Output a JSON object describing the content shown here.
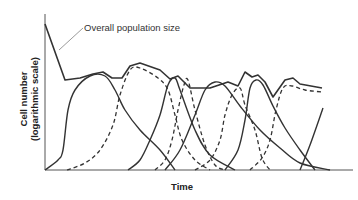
{
  "chart_data": {
    "type": "line",
    "title": "",
    "xlabel": "Time",
    "ylabel_line1": "Cell number",
    "ylabel_line2": "(logarithmic scale)",
    "annotation": "Overall population size",
    "grid": false,
    "legend": "none",
    "ticks": "none",
    "colors": {
      "line": "#333333",
      "axis": "#555555"
    },
    "plot_area": {
      "x0": 45,
      "y0": 170,
      "x1": 353,
      "ytop": 14
    },
    "overall": [
      [
        45,
        24
      ],
      [
        65,
        80
      ],
      [
        80,
        78
      ],
      [
        93,
        74
      ],
      [
        103,
        72
      ],
      [
        112,
        78
      ],
      [
        122,
        78
      ],
      [
        130,
        66
      ],
      [
        140,
        63
      ],
      [
        160,
        70
      ],
      [
        170,
        79
      ],
      [
        178,
        76
      ],
      [
        190,
        88
      ],
      [
        210,
        88
      ],
      [
        228,
        82
      ],
      [
        238,
        86
      ],
      [
        245,
        72
      ],
      [
        252,
        77
      ],
      [
        258,
        75
      ],
      [
        265,
        82
      ],
      [
        273,
        97
      ],
      [
        285,
        80
      ],
      [
        293,
        78
      ],
      [
        300,
        84
      ],
      [
        322,
        88
      ]
    ],
    "subpopulations": [
      {
        "style": "solid",
        "points": [
          [
            45,
            170
          ],
          [
            58,
            160
          ],
          [
            63,
            150
          ],
          [
            68,
            110
          ],
          [
            75,
            90
          ],
          [
            90,
            76
          ],
          [
            105,
            76
          ],
          [
            115,
            90
          ],
          [
            125,
            110
          ],
          [
            140,
            130
          ],
          [
            160,
            150
          ],
          [
            175,
            170
          ]
        ]
      },
      {
        "style": "dashed",
        "points": [
          [
            67,
            170
          ],
          [
            85,
            163
          ],
          [
            100,
            150
          ],
          [
            113,
            125
          ],
          [
            120,
            95
          ],
          [
            130,
            70
          ],
          [
            140,
            68
          ],
          [
            158,
            78
          ],
          [
            168,
            90
          ],
          [
            175,
            115
          ],
          [
            182,
            140
          ],
          [
            195,
            160
          ],
          [
            210,
            170
          ]
        ]
      },
      {
        "style": "solid",
        "points": [
          [
            128,
            170
          ],
          [
            140,
            160
          ],
          [
            150,
            140
          ],
          [
            160,
            115
          ],
          [
            168,
            85
          ],
          [
            175,
            78
          ],
          [
            180,
            90
          ],
          [
            195,
            130
          ],
          [
            210,
            155
          ],
          [
            235,
            170
          ]
        ]
      },
      {
        "style": "dashed",
        "points": [
          [
            155,
            170
          ],
          [
            165,
            160
          ],
          [
            172,
            140
          ],
          [
            178,
            110
          ],
          [
            184,
            85
          ],
          [
            188,
            80
          ],
          [
            195,
            110
          ],
          [
            205,
            145
          ],
          [
            215,
            165
          ],
          [
            225,
            170
          ]
        ]
      },
      {
        "style": "solid",
        "points": [
          [
            165,
            170
          ],
          [
            180,
            150
          ],
          [
            195,
            115
          ],
          [
            205,
            90
          ],
          [
            215,
            82
          ],
          [
            225,
            86
          ],
          [
            240,
            106
          ],
          [
            260,
            130
          ],
          [
            280,
            148
          ],
          [
            300,
            163
          ],
          [
            330,
            170
          ]
        ]
      },
      {
        "style": "dashed",
        "points": [
          [
            195,
            170
          ],
          [
            210,
            160
          ],
          [
            220,
            140
          ],
          [
            225,
            115
          ],
          [
            232,
            95
          ],
          [
            240,
            88
          ],
          [
            245,
            105
          ],
          [
            255,
            130
          ],
          [
            262,
            158
          ],
          [
            270,
            170
          ]
        ]
      },
      {
        "style": "solid",
        "points": [
          [
            225,
            170
          ],
          [
            238,
            150
          ],
          [
            245,
            120
          ],
          [
            250,
            88
          ],
          [
            256,
            80
          ],
          [
            263,
            85
          ],
          [
            273,
            106
          ],
          [
            285,
            128
          ],
          [
            300,
            150
          ],
          [
            315,
            170
          ]
        ]
      },
      {
        "style": "dashed",
        "points": [
          [
            250,
            170
          ],
          [
            262,
            158
          ],
          [
            270,
            140
          ],
          [
            276,
            110
          ],
          [
            283,
            88
          ],
          [
            292,
            86
          ],
          [
            305,
            90
          ],
          [
            322,
            92
          ]
        ]
      },
      {
        "style": "solid",
        "points": [
          [
            300,
            170
          ],
          [
            310,
            145
          ],
          [
            323,
            108
          ]
        ]
      }
    ]
  }
}
